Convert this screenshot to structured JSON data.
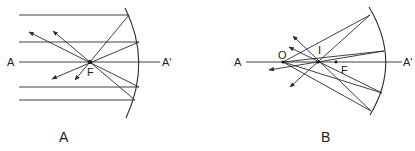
{
  "figures": [
    {
      "id": "A",
      "caption": "A",
      "description": "Concave mirror: parallel rays reflected through focal point F",
      "labels": {
        "axis_left": "A",
        "axis_right": "A'",
        "focus": "F"
      },
      "points": {
        "focus": [
          90,
          62
        ]
      }
    },
    {
      "id": "B",
      "caption": "B",
      "description": "Concave mirror: rays from object point O reflected to image point I",
      "labels": {
        "axis_left": "A",
        "axis_right": "A'",
        "object": "O",
        "image": "I",
        "focus": "F"
      },
      "points": {
        "object": [
          283,
          62
        ],
        "image": [
          318,
          62
        ],
        "focus": [
          336,
          62
        ]
      }
    }
  ],
  "colors": {
    "line": "#2a2a2a",
    "background": "#ffffff"
  }
}
